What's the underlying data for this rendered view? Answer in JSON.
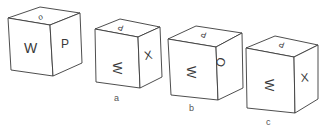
{
  "figure": {
    "type": "cube-folding-puzzle",
    "reference_cube": {
      "front": "W",
      "right": "P",
      "top": "o"
    },
    "options": [
      {
        "label": "a",
        "front": "W",
        "right": "X",
        "top": "P",
        "front_rotation": "rotated 90deg"
      },
      {
        "label": "b",
        "front": "W",
        "right": "O",
        "top": "P",
        "front_rotation": "rotated 90deg"
      },
      {
        "label": "c",
        "front": "W",
        "right": "X",
        "top": "P",
        "front_rotation": "rotated 90deg"
      }
    ]
  },
  "colors": {
    "line": "#3a3a3a",
    "background": "#ffffff",
    "label": "#555555"
  }
}
